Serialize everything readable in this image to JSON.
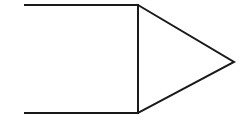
{
  "canvas": {
    "width": 242,
    "height": 121,
    "background_color": "#ffffff",
    "title": "Geometric figure: square with attached triangle"
  },
  "style": {
    "stroke_color": "#1a1a1a",
    "fill": "none",
    "stroke_width_main": 2,
    "stroke_width_thin": 1.4
  },
  "shapes": [
    {
      "name": "square",
      "type": "rectangle",
      "label": "Square",
      "fill": "none",
      "stroke_color": "#1a1a1a",
      "stroke_width": 2,
      "x": 25,
      "y": 5,
      "width": 113,
      "height": 108,
      "points": "25,5 138,5 138,113 25,113"
    },
    {
      "name": "triangle",
      "type": "triangle",
      "label": "Triangle",
      "fill": "none",
      "stroke_color": "#1a1a1a",
      "stroke_width": 2,
      "points": "138,5 234,62 138,113",
      "apex_x": 234,
      "apex_y": 62,
      "base_top_x": 138,
      "base_top_y": 5,
      "base_bottom_x": 138,
      "base_bottom_y": 113
    },
    {
      "name": "shared-edge",
      "type": "line",
      "label": "Shared vertical edge",
      "stroke_color": "#1a1a1a",
      "stroke_width": 2,
      "x1": 138,
      "y1": 5,
      "x2": 138,
      "y2": 113
    }
  ]
}
